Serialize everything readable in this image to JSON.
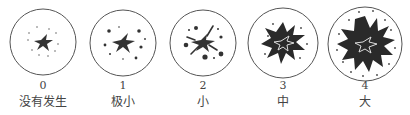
{
  "figure": {
    "stages": [
      {
        "grade": "0",
        "label": "没有发生"
      },
      {
        "grade": "1",
        "label": "极小"
      },
      {
        "grade": "2",
        "label": "小"
      },
      {
        "grade": "3",
        "label": "中"
      },
      {
        "grade": "4",
        "label": "大"
      }
    ]
  }
}
